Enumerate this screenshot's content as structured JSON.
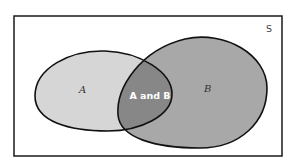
{
  "diagram": {
    "type": "venn",
    "universe": {
      "label": "S",
      "border_color": "#1a1a1a"
    },
    "sets": [
      {
        "id": "A",
        "label": "A",
        "fill": "#d6d6d6"
      },
      {
        "id": "B",
        "label": "B",
        "fill": "#a8a8a8"
      }
    ],
    "intersection": {
      "label": "A and B",
      "fill": "#878787",
      "label_color": "#ffffff"
    },
    "outline_color": "#111111"
  }
}
